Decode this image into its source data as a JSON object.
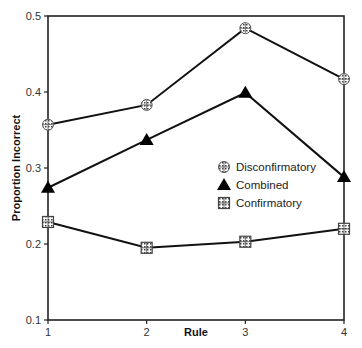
{
  "chart_data": {
    "type": "line",
    "title": "",
    "xlabel": "Rule",
    "ylabel": "Proportion Incorrect",
    "x": [
      1,
      2,
      3,
      4
    ],
    "ylim": [
      0.1,
      0.5
    ],
    "yticks": [
      "0.1",
      "0.2",
      "0.3",
      "0.4",
      "0.5"
    ],
    "xticks": [
      "1",
      "2",
      "3",
      "4"
    ],
    "grid": false,
    "legend_position": "right-middle inside",
    "series": [
      {
        "name": "Disconfirmatory",
        "marker": "circle-crosshatch",
        "values": [
          0.357,
          0.383,
          0.484,
          0.417
        ]
      },
      {
        "name": "Combined",
        "marker": "filled-triangle",
        "values": [
          0.274,
          0.337,
          0.399,
          0.288
        ]
      },
      {
        "name": "Confirmatory",
        "marker": "square-grid",
        "values": [
          0.229,
          0.195,
          0.203,
          0.22
        ]
      }
    ]
  }
}
